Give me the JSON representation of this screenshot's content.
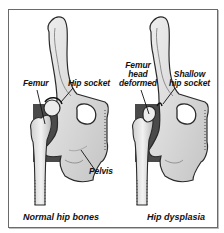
{
  "diagram": {
    "panels": [
      {
        "id": "normal",
        "caption": "Normal hip bones",
        "labels": {
          "femur": "Femur",
          "hip_socket": "Hip socket",
          "pelvis": "Pelvis"
        }
      },
      {
        "id": "dysplasia",
        "caption": "Hip dysplasia",
        "labels": {
          "femur_head_line1": "Femur",
          "femur_head_line2": "head",
          "femur_head_line3": "deformed",
          "shallow_line1": "Shallow",
          "shallow_line2": "hip socket"
        }
      }
    ],
    "colors": {
      "bone_fill": "#d6d6d6",
      "bone_light": "#ececec",
      "bone_outline": "#2a2a2a",
      "background_block": "#4a4a4a",
      "frame_border": "#6a6a6a"
    }
  }
}
